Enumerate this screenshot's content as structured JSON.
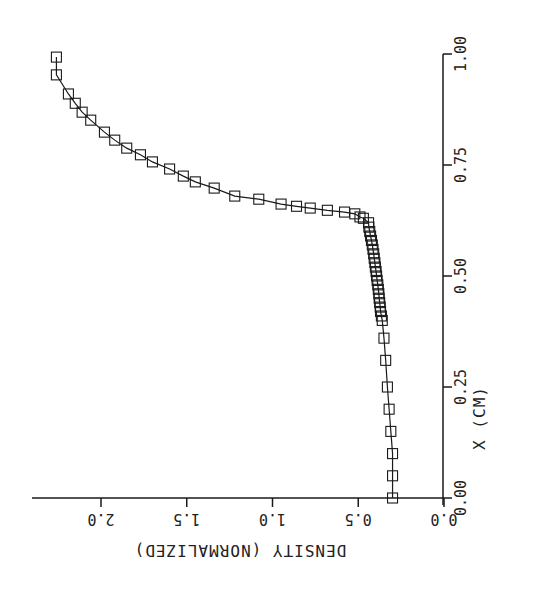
{
  "chart_data": {
    "type": "line",
    "title": "",
    "orientation": "rotated: X (CM) runs vertically upward along right edge; density runs horizontally to the left along bottom (labels printed upside-down)",
    "xlabel": "X (CM)",
    "ylabel": "DENSITY (NORMALIZED)",
    "xlim": [
      0.0,
      1.0
    ],
    "ylim": [
      0.0,
      2.3
    ],
    "x_ticks": [
      "0.00",
      "0.25",
      "0.50",
      "0.75",
      "1.00"
    ],
    "y_ticks": [
      "0.0",
      "0.5",
      "1.0",
      "1.5",
      "2.0"
    ],
    "grid": false,
    "legend": null,
    "marker": "open-square",
    "line_color": "#1a1a1a",
    "series": [
      {
        "name": "density",
        "points": [
          [
            0.0,
            0.3
          ],
          [
            0.05,
            0.3
          ],
          [
            0.1,
            0.3
          ],
          [
            0.15,
            0.31
          ],
          [
            0.2,
            0.32
          ],
          [
            0.25,
            0.33
          ],
          [
            0.31,
            0.34
          ],
          [
            0.36,
            0.35
          ],
          [
            0.4,
            0.36
          ],
          [
            0.41,
            0.365
          ],
          [
            0.42,
            0.37
          ],
          [
            0.43,
            0.372
          ],
          [
            0.44,
            0.375
          ],
          [
            0.45,
            0.378
          ],
          [
            0.46,
            0.38
          ],
          [
            0.47,
            0.383
          ],
          [
            0.48,
            0.386
          ],
          [
            0.49,
            0.39
          ],
          [
            0.5,
            0.393
          ],
          [
            0.51,
            0.396
          ],
          [
            0.52,
            0.4
          ],
          [
            0.53,
            0.403
          ],
          [
            0.54,
            0.407
          ],
          [
            0.55,
            0.41
          ],
          [
            0.56,
            0.414
          ],
          [
            0.57,
            0.418
          ],
          [
            0.58,
            0.423
          ],
          [
            0.59,
            0.428
          ],
          [
            0.6,
            0.433
          ],
          [
            0.61,
            0.438
          ],
          [
            0.62,
            0.44
          ],
          [
            0.63,
            0.47
          ],
          [
            0.633,
            0.49
          ],
          [
            0.64,
            0.52
          ],
          [
            0.644,
            0.58
          ],
          [
            0.648,
            0.68
          ],
          [
            0.653,
            0.78
          ],
          [
            0.657,
            0.86
          ],
          [
            0.662,
            0.95
          ],
          [
            0.673,
            1.08
          ],
          [
            0.68,
            1.22
          ],
          [
            0.698,
            1.34
          ],
          [
            0.712,
            1.45
          ],
          [
            0.725,
            1.52
          ],
          [
            0.741,
            1.6
          ],
          [
            0.757,
            1.7
          ],
          [
            0.773,
            1.77
          ],
          [
            0.788,
            1.85
          ],
          [
            0.806,
            1.92
          ],
          [
            0.824,
            1.98
          ],
          [
            0.851,
            2.06
          ],
          [
            0.869,
            2.11
          ],
          [
            0.889,
            2.15
          ],
          [
            0.91,
            2.19
          ],
          [
            0.953,
            2.26
          ],
          [
            0.993,
            2.26
          ]
        ]
      }
    ]
  },
  "axes": {
    "x_axis_title": "X (CM)",
    "y_axis_title": "DENSITY (NORMALIZED)",
    "x_tick_labels": [
      "0.00",
      "0.25",
      "0.50",
      "0.75",
      "1.00"
    ],
    "y_tick_labels": [
      "0.0",
      "0.5",
      "1.0",
      "1.5",
      "2.0"
    ]
  }
}
